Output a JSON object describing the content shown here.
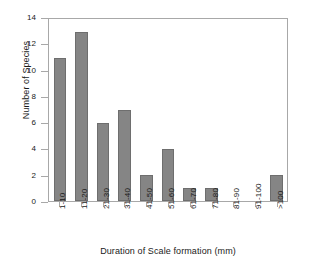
{
  "chart_data": {
    "type": "bar",
    "title": "",
    "xlabel": "Duration of Scale formation (mm)",
    "ylabel": "Number of Species",
    "categories": [
      "1-10",
      "11-20",
      "21-30",
      "31-40",
      "41-50",
      "51-60",
      "61-70",
      "71-80",
      "81-90",
      "91-100",
      ">100"
    ],
    "values": [
      11,
      13,
      6,
      7,
      2,
      4,
      1,
      1,
      0,
      0,
      2
    ],
    "ylim": [
      0,
      14
    ],
    "yticks": [
      0,
      2,
      4,
      6,
      8,
      10,
      12,
      14
    ],
    "ytick_labels": [
      "0",
      "2",
      "4",
      "6",
      "8",
      "10",
      "12",
      "14"
    ],
    "grid": false,
    "legend": null,
    "bar_color": "#858585",
    "bar_edge_color": "#6e6e6e",
    "frame_color": "#a8a8a8",
    "background": "#ffffff",
    "text_color": "#1a1a1a"
  }
}
